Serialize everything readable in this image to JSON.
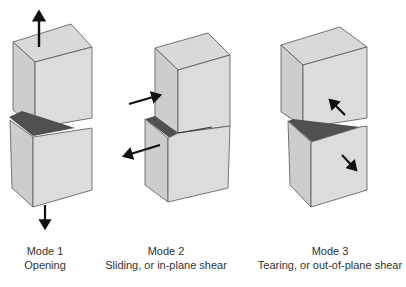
{
  "colors": {
    "face_top": "#d8d8d8",
    "face_left": "#cfcfcf",
    "face_front": "#dadada",
    "edge": "#555555",
    "crack": "#505050",
    "arrow": "#111111",
    "text": "#333333"
  },
  "modes": [
    {
      "id": "mode-1",
      "name": "Mode 1",
      "description": "Opening",
      "loading": "tensile force normal to crack plane",
      "arrows": [
        "up",
        "down"
      ]
    },
    {
      "id": "mode-2",
      "name": "Mode 2",
      "description": "Sliding, or in-plane shear",
      "loading": "shear force parallel to crack plane, perpendicular to crack front",
      "arrows": [
        "in-right",
        "out-left"
      ]
    },
    {
      "id": "mode-3",
      "name": "Mode 3",
      "description": "Tearing, or out-of-plane shear",
      "loading": "shear force parallel to crack plane and crack front",
      "arrows": [
        "up-left",
        "down-right"
      ]
    }
  ]
}
